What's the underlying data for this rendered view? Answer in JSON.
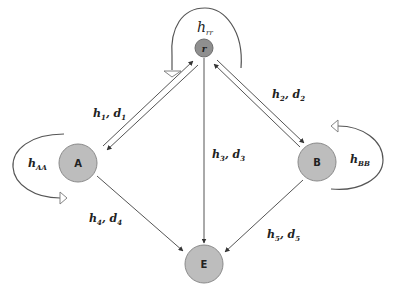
{
  "diagram": {
    "type": "state-transition",
    "nodes": [
      {
        "id": "r",
        "label": "r",
        "cx": 204,
        "cy": 48,
        "r": 9,
        "fill": "#8f8f8f"
      },
      {
        "id": "A",
        "label": "A",
        "cx": 78,
        "cy": 163,
        "r": 19,
        "fill": "#bdbdbd"
      },
      {
        "id": "B",
        "label": "B",
        "cx": 317,
        "cy": 162,
        "r": 19,
        "fill": "#bdbdbd"
      },
      {
        "id": "E",
        "label": "E",
        "cx": 204,
        "cy": 264,
        "r": 19,
        "fill": "#bdbdbd"
      }
    ],
    "self_loops": [
      {
        "node": "r",
        "label_main": "h",
        "label_sub": "rr"
      },
      {
        "node": "A",
        "label_main": "h",
        "label_sub": "AA"
      },
      {
        "node": "B",
        "label_main": "h",
        "label_sub": "BB"
      }
    ],
    "edges": [
      {
        "from": "r",
        "to": "A",
        "bidirectional": true,
        "label": {
          "h": "h",
          "h_sub": "1",
          "d": "d",
          "d_sub": "1"
        }
      },
      {
        "from": "r",
        "to": "B",
        "bidirectional": true,
        "label": {
          "h": "h",
          "h_sub": "2",
          "d": "d",
          "d_sub": "2"
        }
      },
      {
        "from": "r",
        "to": "E",
        "bidirectional": false,
        "label": {
          "h": "h",
          "h_sub": "3",
          "d": "d",
          "d_sub": "3"
        }
      },
      {
        "from": "A",
        "to": "E",
        "bidirectional": false,
        "label": {
          "h": "h",
          "h_sub": "4",
          "d": "d",
          "d_sub": "4"
        }
      },
      {
        "from": "B",
        "to": "E",
        "bidirectional": false,
        "label": {
          "h": "h",
          "h_sub": "5",
          "d": "d",
          "d_sub": "5"
        }
      }
    ],
    "colors": {
      "edge": "#555555",
      "node_outline": "#8a8a8a",
      "node_fill": "#bdbdbd",
      "root_fill": "#8f8f8f",
      "text": "#222222"
    }
  }
}
